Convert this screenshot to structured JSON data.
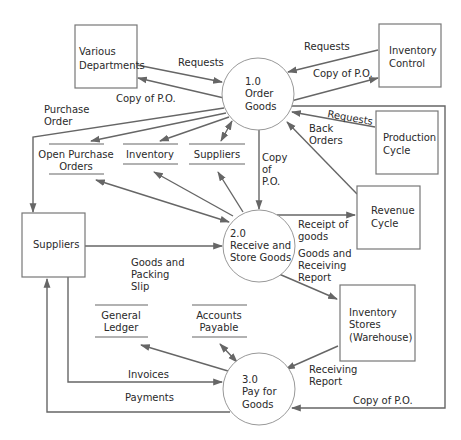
{
  "diagram": {
    "type": "data-flow-diagram",
    "colors": {
      "line": "#666666",
      "text": "#2a2a2a",
      "background": "#ffffff"
    },
    "entities": {
      "various_departments": [
        "Various",
        "Departments"
      ],
      "inventory_control": [
        "Inventory",
        "Control"
      ],
      "production_cycle": [
        "Production",
        "Cycle"
      ],
      "suppliers": [
        "Suppliers"
      ],
      "revenue_cycle": [
        "Revenue",
        "Cycle"
      ],
      "inventory_stores": [
        "Inventory",
        "Stores",
        "(Warehouse)"
      ]
    },
    "processes": {
      "p1": [
        "1.0",
        "Order",
        "Goods"
      ],
      "p2": [
        "2.0",
        "Receive and",
        "Store Goods"
      ],
      "p3": [
        "3.0",
        "Pay for",
        "Goods"
      ]
    },
    "data_stores": {
      "open_purchase_orders": [
        "Open Purchase",
        "Orders"
      ],
      "inventory": [
        "Inventory"
      ],
      "suppliers": [
        "Suppliers"
      ],
      "general_ledger": [
        "General",
        "Ledger"
      ],
      "accounts_payable": [
        "Accounts",
        "Payable"
      ]
    },
    "flows": {
      "requests_depts": [
        "Requests"
      ],
      "copy_po_depts": [
        "Copy of P.O."
      ],
      "requests_invctl": [
        "Requests"
      ],
      "copy_po_invctl": [
        "Copy of P.O."
      ],
      "requests_prod": [
        "Requests"
      ],
      "back_orders": [
        "Back",
        "Orders"
      ],
      "purchase_order": [
        "Purchase",
        "Order"
      ],
      "copy_po_p2": [
        "Copy",
        "of",
        "P.O."
      ],
      "receipt_goods": [
        "Receipt of",
        "goods"
      ],
      "goods_receiving": [
        "Goods and",
        "Receiving",
        "Report"
      ],
      "goods_packing": [
        "Goods and",
        "Packing",
        "Slip"
      ],
      "receiving_report": [
        "Receiving",
        "Report"
      ],
      "invoices": [
        "Invoices"
      ],
      "payments": [
        "Payments"
      ],
      "copy_po_p3": [
        "Copy of P.O."
      ]
    }
  }
}
